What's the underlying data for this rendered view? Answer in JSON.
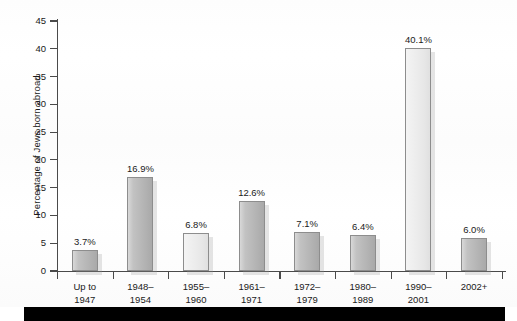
{
  "chart_data": {
    "type": "bar",
    "title": "",
    "subtitle": "",
    "xlabel": "",
    "ylabel": "Percentage of Jews born abroad",
    "ylim": [
      0,
      45
    ],
    "yticks": [
      0,
      5,
      10,
      15,
      20,
      25,
      30,
      35,
      40,
      45
    ],
    "ytick_labels": [
      "0",
      "5",
      "10",
      "15",
      "20",
      "25",
      "30",
      "35",
      "40",
      "45"
    ],
    "grid": false,
    "legend": null,
    "categories": [
      "Up to 1947",
      "1948–1954",
      "1955–1960",
      "1961–1971",
      "1972–1979",
      "1980–1989",
      "1990–2001",
      "2002+"
    ],
    "category_lines": [
      [
        "Up to",
        "1947"
      ],
      [
        "1948–",
        "1954"
      ],
      [
        "1955–",
        "1960"
      ],
      [
        "1961–",
        "1971"
      ],
      [
        "1972–",
        "1979"
      ],
      [
        "1980–",
        "1989"
      ],
      [
        "1990–",
        "2001"
      ],
      [
        "2002+",
        ""
      ]
    ],
    "values": [
      3.7,
      16.9,
      6.8,
      12.6,
      7.1,
      6.4,
      40.1,
      6.0
    ],
    "data_labels": [
      "3.7%",
      "16.9%",
      "6.8%",
      "12.6%",
      "7.1%",
      "6.4%",
      "40.1%",
      "6.0%"
    ],
    "bar_styles": [
      "dark",
      "dark",
      "light",
      "dark",
      "dark",
      "dark",
      "light",
      "dark"
    ],
    "colors": {
      "bar_dark_left": "#d8d8d8",
      "bar_dark_right": "#a9a9a9",
      "bar_light_left": "#f4f4f4",
      "bar_light_right": "#e0e0e0",
      "bar_border": "#8d8d8d",
      "axis": "#4a4a4a",
      "text": "#1a1a1a",
      "background": "#ffffff",
      "footer_bar": "#000000"
    }
  }
}
